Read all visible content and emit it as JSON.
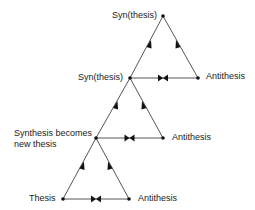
{
  "diagram": {
    "type": "dialectic-spiral",
    "line_color": "#555555",
    "node_color": "#111111",
    "labels": {
      "top_synthesis": "Syn(thesis)",
      "mid_synthesis": "Syn(thesis)",
      "mid_antithesis": "Antithesis",
      "new_thesis_line1": "Synthesis becomes",
      "new_thesis_line2": "new thesis",
      "low_antithesis": "Antithesis",
      "thesis": "Thesis",
      "bottom_antithesis": "Antithesis"
    },
    "nodes": [
      {
        "id": "top",
        "x": 163,
        "y": 16
      },
      {
        "id": "mid-left",
        "x": 130,
        "y": 78
      },
      {
        "id": "mid-right",
        "x": 198,
        "y": 78
      },
      {
        "id": "low-left",
        "x": 96,
        "y": 138
      },
      {
        "id": "low-right",
        "x": 163,
        "y": 138
      },
      {
        "id": "bottom-left",
        "x": 63,
        "y": 199
      },
      {
        "id": "bottom-right",
        "x": 129,
        "y": 199
      }
    ],
    "edges": [
      {
        "from": "mid-left",
        "to": "top",
        "arrow": "toward-top"
      },
      {
        "from": "mid-right",
        "to": "top",
        "arrow": "toward-top"
      },
      {
        "from": "mid-left",
        "to": "mid-right",
        "arrow": "bowtie"
      },
      {
        "from": "low-left",
        "to": "mid-left",
        "arrow": "toward-top"
      },
      {
        "from": "low-right",
        "to": "mid-left",
        "arrow": "toward-top"
      },
      {
        "from": "low-left",
        "to": "low-right",
        "arrow": "bowtie"
      },
      {
        "from": "bottom-left",
        "to": "low-left",
        "arrow": "toward-top"
      },
      {
        "from": "bottom-right",
        "to": "low-left",
        "arrow": "toward-top"
      },
      {
        "from": "bottom-left",
        "to": "bottom-right",
        "arrow": "bowtie"
      }
    ]
  }
}
